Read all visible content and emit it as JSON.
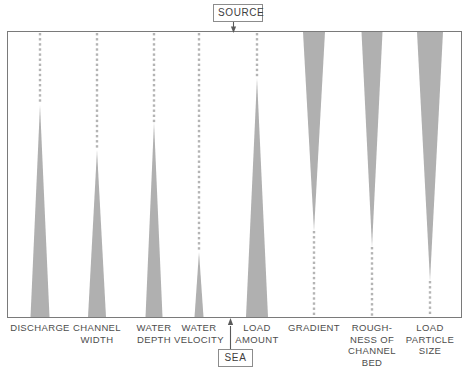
{
  "diagram": {
    "title_top": "SOURCE",
    "title_bottom": "SEA",
    "frame": {
      "x": 7,
      "y": 31,
      "w": 454,
      "h": 286,
      "stroke": "#7a7a7a"
    },
    "wedge_color": "#b0b0b0",
    "dot_color": "#b4b4b4",
    "arrow_color": "#5a5a5a",
    "columns": [
      {
        "id": "discharge",
        "label": "DISCHARGE",
        "center_x": 40,
        "orientation": "widens-downstream",
        "apex_y": 105,
        "base_y": 317,
        "base_half_width": 9.5,
        "dot_from_y": 33,
        "dot_to_y": 105
      },
      {
        "id": "channel-width",
        "label": "CHANNEL\nWIDTH",
        "center_x": 97,
        "orientation": "widens-downstream",
        "apex_y": 150,
        "base_y": 317,
        "base_half_width": 9.0,
        "dot_from_y": 33,
        "dot_to_y": 150
      },
      {
        "id": "water-depth",
        "label": "WATER\nDEPTH",
        "center_x": 154,
        "orientation": "widens-downstream",
        "apex_y": 122,
        "base_y": 317,
        "base_half_width": 8.5,
        "dot_from_y": 33,
        "dot_to_y": 122
      },
      {
        "id": "water-velocity",
        "label": "WATER\nVELOCITY",
        "center_x": 199,
        "orientation": "widens-downstream",
        "apex_y": 252,
        "base_y": 317,
        "base_half_width": 4.5,
        "dot_from_y": 33,
        "dot_to_y": 252
      },
      {
        "id": "load-amount",
        "label": "LOAD\nAMOUNT",
        "center_x": 257,
        "orientation": "widens-downstream",
        "apex_y": 78,
        "base_y": 317,
        "base_half_width": 11.0,
        "dot_from_y": 33,
        "dot_to_y": 78
      },
      {
        "id": "gradient",
        "label": "GRADIENT",
        "center_x": 314,
        "orientation": "narrows-downstream",
        "apex_y": 231,
        "base_y": 32,
        "base_half_width": 11.0,
        "dot_from_y": 231,
        "dot_to_y": 316
      },
      {
        "id": "roughness-of-channel-bed",
        "label": "ROUGH-\nNESS OF\nCHANNEL\nBED",
        "center_x": 372,
        "orientation": "narrows-downstream",
        "apex_y": 247,
        "base_y": 32,
        "base_half_width": 10.5,
        "dot_from_y": 247,
        "dot_to_y": 316
      },
      {
        "id": "load-particle-size",
        "label": "LOAD\nPARTICLE\nSIZE",
        "center_x": 430,
        "orientation": "narrows-downstream",
        "apex_y": 281,
        "base_y": 32,
        "base_half_width": 13.0,
        "dot_from_y": 281,
        "dot_to_y": 316
      }
    ]
  }
}
